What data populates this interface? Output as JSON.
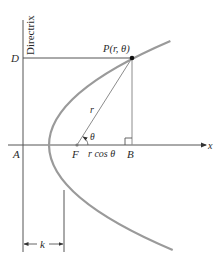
{
  "figure": {
    "colors": {
      "curve": "#9a9a9a",
      "lines": "#555555",
      "construction": "#8c8c8c",
      "text": "#2a2a2a",
      "background": "#ffffff"
    },
    "labels": {
      "directrix": "Directrix",
      "D": "D",
      "P": "P(r, θ)",
      "r": "r",
      "theta": "θ",
      "A": "A",
      "F": "F",
      "rcos": "r cos θ",
      "B": "B",
      "x_axis": "x",
      "k": "k"
    },
    "elements": [
      {
        "name": "directrix-line",
        "description": "vertical line x = A"
      },
      {
        "name": "x-axis",
        "description": "horizontal axis with arrow"
      },
      {
        "name": "parabola",
        "description": "parabola opening right, focus F"
      },
      {
        "name": "segment-DP",
        "description": "horizontal from D to P"
      },
      {
        "name": "segment-FP",
        "description": "radius r from F to P"
      },
      {
        "name": "segment-PB",
        "description": "perpendicular from P to axis at B"
      },
      {
        "name": "right-angle-marker",
        "description": "at B"
      },
      {
        "name": "angle-theta",
        "description": "angle at F between axis and FP"
      },
      {
        "name": "dimension-k",
        "description": "distance k from directrix to focus"
      }
    ]
  }
}
